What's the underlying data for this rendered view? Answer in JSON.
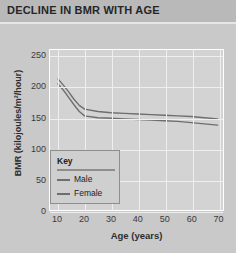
{
  "header": {
    "title": "DECLINE IN BMR WITH AGE"
  },
  "chart_data": {
    "type": "line",
    "title": "DECLINE IN BMR WITH AGE",
    "xlabel": "Age (years)",
    "ylabel": "BMR (kilojoules/m²/hour)",
    "xlim": [
      7,
      72
    ],
    "ylim": [
      0,
      260
    ],
    "xticks": [
      10,
      20,
      30,
      40,
      50,
      60,
      70
    ],
    "yticks": [
      0,
      50,
      100,
      150,
      200,
      250
    ],
    "grid": true,
    "legend_position": "lower-left-inside",
    "legend_title": "Key",
    "x": [
      10,
      12,
      14,
      16,
      18,
      20,
      25,
      30,
      35,
      40,
      45,
      50,
      55,
      60,
      65,
      70
    ],
    "series": [
      {
        "name": "Male",
        "color": "#6e6e6e",
        "values": [
          213,
          203,
          192,
          180,
          170,
          164,
          160,
          158,
          157,
          156,
          155,
          154,
          153,
          152,
          150,
          148
        ]
      },
      {
        "name": "Female",
        "color": "#6e6e6e",
        "values": [
          205,
          195,
          183,
          171,
          160,
          153,
          150,
          149,
          148,
          147,
          146,
          145,
          144,
          142,
          140,
          138
        ]
      }
    ]
  },
  "colors": {
    "header_bar": "#b9b9b9",
    "page_bg": "#c9c9c9",
    "plot_bg": "#d3d3d3",
    "gridline": "#efefef",
    "curve": "#6e6e6e",
    "legend_bg": "#cfcfcf",
    "legend_border": "#8e8e8e"
  }
}
